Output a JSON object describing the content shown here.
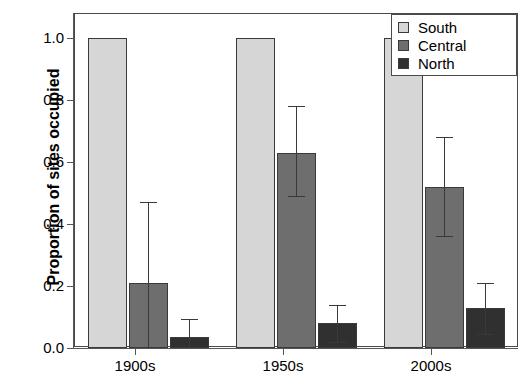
{
  "chart_data": {
    "type": "bar",
    "title": "",
    "xlabel": "",
    "ylabel": "Proportion of sites occupied",
    "categories": [
      "1900s",
      "1950s",
      "2000s"
    ],
    "ylim": [
      0.0,
      1.08
    ],
    "yticks": [
      0.0,
      0.2,
      0.4,
      0.6,
      0.8,
      1.0
    ],
    "ytick_labels": [
      "0.0",
      "0.2",
      "0.4",
      "0.6",
      "0.8",
      "1.0"
    ],
    "grid": false,
    "legend_position": "top-right",
    "series": [
      {
        "name": "South",
        "color": "#d6d6d6",
        "values": [
          1.0,
          1.0,
          1.0
        ],
        "err_low": [
          null,
          null,
          null
        ],
        "err_high": [
          null,
          null,
          null
        ]
      },
      {
        "name": "Central",
        "color": "#6e6e6e",
        "values": [
          0.21,
          0.63,
          0.52
        ],
        "err_low": [
          null,
          0.49,
          0.36
        ],
        "err_high": [
          0.47,
          0.78,
          0.68
        ]
      },
      {
        "name": "North",
        "color": "#303030",
        "values": [
          0.035,
          0.08,
          0.13
        ],
        "err_low": [
          null,
          0.02,
          0.045
        ],
        "err_high": [
          0.095,
          0.14,
          0.21
        ]
      }
    ]
  },
  "legend": {
    "items": [
      {
        "label": "South",
        "color": "#d6d6d6"
      },
      {
        "label": "Central",
        "color": "#6e6e6e"
      },
      {
        "label": "North",
        "color": "#303030"
      }
    ]
  },
  "axes": {
    "y_title": "Proportion of sites occupied"
  }
}
